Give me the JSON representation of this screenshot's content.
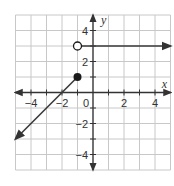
{
  "chart_data": {
    "type": "line",
    "title": "",
    "xlabel": "x",
    "ylabel": "y",
    "xlim": [
      -5,
      5
    ],
    "ylim": [
      -5,
      5
    ],
    "grid": true,
    "x_ticks": [
      -4,
      -2,
      0,
      2,
      4
    ],
    "y_ticks": [
      4,
      2,
      -2,
      -4
    ],
    "x_tick_labels": [
      "−4",
      "−2",
      "0",
      "2",
      "4"
    ],
    "y_tick_labels": [
      "4",
      "2",
      "−2",
      "−4"
    ],
    "series": [
      {
        "name": "ray y=3",
        "points": [
          [
            -1,
            3
          ],
          [
            5,
            3
          ]
        ],
        "start_marker": "open-circle",
        "end_marker": "arrow"
      },
      {
        "name": "line segment",
        "points": [
          [
            -1,
            1
          ],
          [
            -5,
            -3
          ]
        ],
        "start_marker": "closed-circle",
        "end_marker": "arrow"
      }
    ],
    "colors": {
      "grid": "#c8c8c8",
      "axes": "#333333",
      "line": "#3a3a3a",
      "point": "#1a1a1a"
    }
  }
}
